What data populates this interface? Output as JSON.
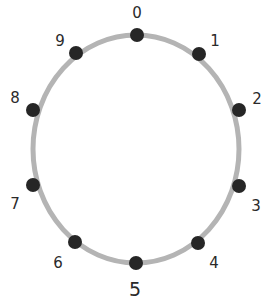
{
  "diagram": {
    "type": "number-ring",
    "ring": {
      "cx": 136,
      "cy": 149,
      "rx": 103,
      "ry": 114,
      "stroke": "#b4b4b4",
      "stroke_width": 5
    },
    "dot_color": "#262626",
    "dot_radius": 7,
    "label_color": "#2a2a2a",
    "points": [
      {
        "label": "0",
        "dot": [
          137,
          35
        ],
        "text": [
          137,
          18
        ],
        "size": 15
      },
      {
        "label": "1",
        "dot": [
          199,
          54
        ],
        "text": [
          215,
          46
        ],
        "size": 15
      },
      {
        "label": "2",
        "dot": [
          239,
          110
        ],
        "text": [
          257,
          104
        ],
        "size": 15
      },
      {
        "label": "3",
        "dot": [
          239,
          186
        ],
        "text": [
          256,
          211
        ],
        "size": 15
      },
      {
        "label": "4",
        "dot": [
          198,
          243
        ],
        "text": [
          214,
          268
        ],
        "size": 15
      },
      {
        "label": "5",
        "dot": [
          136,
          263
        ],
        "text": [
          135,
          296
        ],
        "size": 19
      },
      {
        "label": "6",
        "dot": [
          75,
          242
        ],
        "text": [
          58,
          268
        ],
        "size": 15
      },
      {
        "label": "7",
        "dot": [
          33,
          185
        ],
        "text": [
          15,
          209
        ],
        "size": 15
      },
      {
        "label": "8",
        "dot": [
          33,
          110
        ],
        "text": [
          15,
          103
        ],
        "size": 15
      },
      {
        "label": "9",
        "dot": [
          76,
          53
        ],
        "text": [
          60,
          46
        ],
        "size": 15
      }
    ]
  }
}
